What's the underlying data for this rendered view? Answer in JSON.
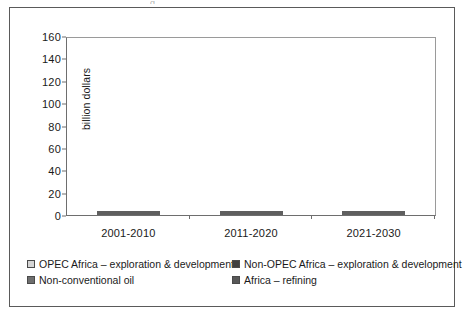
{
  "figure": {
    "title_remnant": "g",
    "frame_color": "#5a5a5a",
    "background": "#ffffff"
  },
  "chart_data": {
    "type": "bar",
    "subtype": "stacked-vertical",
    "title": "",
    "xlabel": "",
    "ylabel": "billion dollars",
    "ylim": [
      0,
      160
    ],
    "ytick_step": 20,
    "yticks": [
      "160",
      "140",
      "120",
      "100",
      "80",
      "60",
      "40",
      "20",
      "0"
    ],
    "grid": false,
    "legend_position": "bottom",
    "categories": [
      "2001-2010",
      "2011-2020",
      "2021-2030"
    ],
    "series": [
      {
        "name": "OPEC Africa – exploration & development",
        "color": "#d5d5d5",
        "values": [
          27,
          51,
          62
        ]
      },
      {
        "name": "Non-OPEC Africa – exploration & development",
        "color": "#3f3f3f",
        "values": [
          47,
          61,
          63
        ]
      },
      {
        "name": "Non-conventional oil",
        "color": "#6e6e6e",
        "values": [
          1,
          2,
          3
        ]
      },
      {
        "name": "Africa – refining",
        "color": "#585858",
        "values": [
          7,
          16,
          22
        ]
      }
    ],
    "totals": [
      82,
      130,
      150
    ]
  }
}
